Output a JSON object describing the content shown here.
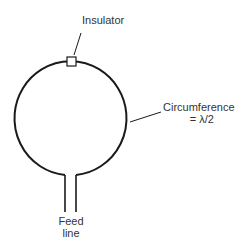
{
  "diagram": {
    "type": "loop-antenna",
    "labels": {
      "insulator": "Insulator",
      "circumference_line1": "Circumference",
      "circumference_line2": "= λ/2",
      "feed_line1": "Feed",
      "feed_line2": "line"
    },
    "colors": {
      "stroke": "#1a1a1a",
      "text": "#333333",
      "background": "#ffffff"
    }
  }
}
